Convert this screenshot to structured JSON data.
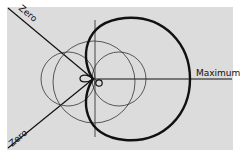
{
  "diagram": {
    "type": "polar radiation pattern",
    "labels": {
      "maximum": "Maximum",
      "zero_upper": "Zero",
      "zero_lower": "Zero"
    },
    "colors": {
      "background_panel": "#dcdcdc",
      "page": "#ffffff",
      "line": "#111111"
    },
    "elements": [
      {
        "name": "cardioid",
        "style": "thick",
        "description": "large heavy cardioid pattern pointing toward Maximum"
      },
      {
        "name": "left-lobe-circle",
        "style": "thin"
      },
      {
        "name": "right-lobe-circle",
        "style": "thin"
      },
      {
        "name": "center-circle",
        "style": "thin"
      },
      {
        "name": "vertical-axis",
        "style": "thin"
      },
      {
        "name": "maximum-axis",
        "style": "medium"
      },
      {
        "name": "zero-line-upper",
        "style": "medium"
      },
      {
        "name": "zero-line-lower",
        "style": "medium"
      },
      {
        "name": "small-loop-left",
        "style": "medium"
      },
      {
        "name": "small-circle-right",
        "style": "medium"
      }
    ]
  }
}
